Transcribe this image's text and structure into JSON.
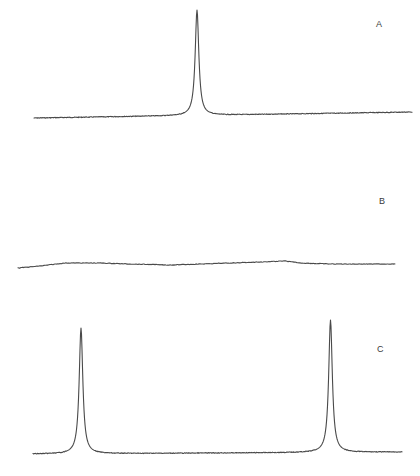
{
  "chart_data": [
    {
      "type": "line",
      "panel": "A",
      "title": "",
      "xlabel": "",
      "ylabel": "",
      "grid": false,
      "axes_visible": false,
      "description": "Single sharp Lorentzian-like peak near center on a slightly sloping baseline",
      "baseline": {
        "x_start": 34,
        "y_start": 118,
        "x_end": 412,
        "y_end": 112
      },
      "peaks": [
        {
          "x": 197,
          "apex_y": 10,
          "half_width": 2.2
        }
      ],
      "label": {
        "text": "A",
        "x": 376,
        "y": 20
      }
    },
    {
      "type": "line",
      "panel": "B",
      "title": "",
      "xlabel": "",
      "ylabel": "",
      "grid": false,
      "axes_visible": false,
      "description": "Flat baseline with no significant peaks; slight undulation",
      "baseline_points": [
        [
          18,
          268
        ],
        [
          40,
          266
        ],
        [
          65,
          263
        ],
        [
          100,
          263
        ],
        [
          130,
          264
        ],
        [
          170,
          265
        ],
        [
          200,
          264
        ],
        [
          230,
          263
        ],
        [
          260,
          262
        ],
        [
          285,
          261
        ],
        [
          300,
          263
        ],
        [
          330,
          264
        ],
        [
          360,
          264
        ],
        [
          395,
          264
        ]
      ],
      "peaks": [],
      "label": {
        "text": "B",
        "x": 379,
        "y": 197
      }
    },
    {
      "type": "line",
      "panel": "C",
      "title": "",
      "xlabel": "",
      "ylabel": "",
      "grid": false,
      "axes_visible": false,
      "description": "Two sharp Lorentzian-like peaks near left and right edges on a flat baseline",
      "baseline": {
        "x_start": 33,
        "y_start": 454,
        "x_end": 402,
        "y_end": 452
      },
      "peaks": [
        {
          "x": 81,
          "apex_y": 328,
          "half_width": 2.2
        },
        {
          "x": 330.5,
          "apex_y": 320,
          "half_width": 2.2
        }
      ],
      "label": {
        "text": "C",
        "x": 377,
        "y": 345
      }
    }
  ],
  "colors": {
    "trace": "#4a4a4a",
    "label": "#3a3a3a",
    "background": "#ffffff"
  },
  "labels": {
    "A": "A",
    "B": "B",
    "C": "C"
  }
}
